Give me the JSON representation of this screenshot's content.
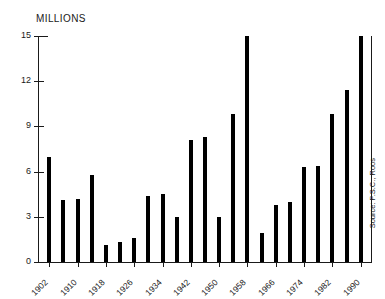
{
  "chart_data": {
    "type": "bar",
    "title": "",
    "ylabel": "MILLIONS",
    "xlabel": "",
    "ylim": [
      0,
      15
    ],
    "grid": false,
    "legend": null,
    "source_note": "Source: P.S.C., Roos",
    "y_ticks": [
      {
        "value": 0,
        "label": "0"
      },
      {
        "value": 3,
        "label": "3"
      },
      {
        "value": 6,
        "label": "6"
      },
      {
        "value": 9,
        "label": "9"
      },
      {
        "value": 12,
        "label": "12"
      },
      {
        "value": 15,
        "label": "15"
      }
    ],
    "x_tick_labels": [
      "1902",
      "1910",
      "1918",
      "1926",
      "1934",
      "1942",
      "1950",
      "1958",
      "1966",
      "1974",
      "1982",
      "1990"
    ],
    "categories": [
      "1902",
      "1906",
      "1910",
      "1914",
      "1918",
      "1922",
      "1926",
      "1930",
      "1934",
      "1938",
      "1942",
      "1946",
      "1950",
      "1954",
      "1958",
      "1962",
      "1966",
      "1970",
      "1974",
      "1978",
      "1982",
      "1986",
      "1990"
    ],
    "values": [
      7.0,
      4.1,
      4.2,
      5.8,
      1.1,
      1.3,
      1.6,
      4.4,
      4.5,
      3.0,
      8.1,
      8.3,
      3.0,
      9.8,
      15.0,
      1.9,
      3.8,
      4.0,
      6.3,
      6.4,
      9.8,
      11.4,
      15.0
    ]
  }
}
